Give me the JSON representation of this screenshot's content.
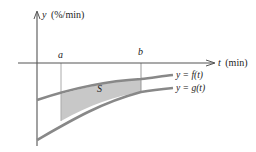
{
  "diagram": {
    "y_axis_label": "y (%/min)",
    "y_axis_var": "y",
    "y_axis_unit": "(%/min)",
    "t_axis_label": "t (min)",
    "t_axis_var": "t",
    "t_axis_unit": "(min)",
    "a_label": "a",
    "b_label": "b",
    "region_label": "S",
    "curve_f_label": "y = f(t)",
    "curve_g_label": "y = g(t)",
    "colors": {
      "axis": "#555555",
      "curve": "#888888",
      "region_fill": "#c8c8c8",
      "guide": "#aaaaaa",
      "text": "#222222"
    }
  }
}
